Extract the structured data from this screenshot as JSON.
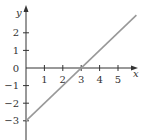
{
  "chart_data": {
    "type": "line",
    "title": "",
    "xlabel": "x",
    "ylabel": "y",
    "xlim": [
      0,
      6
    ],
    "ylim": [
      -3.8,
      3.6
    ],
    "grid": false,
    "legend": null,
    "x_ticks": [
      1,
      2,
      3,
      4,
      5
    ],
    "y_ticks": [
      2,
      1,
      0,
      -1,
      -2,
      -3
    ],
    "x_tick_labels": [
      "1",
      "2",
      "3",
      "4",
      "5"
    ],
    "y_tick_labels": [
      "2",
      "1",
      "0",
      "−1",
      "−2",
      "−3"
    ],
    "series": [
      {
        "name": "y = x - 3",
        "x": [
          0,
          6
        ],
        "y": [
          -3,
          3
        ],
        "color": "#999999"
      }
    ],
    "annotations": [
      {
        "type": "point",
        "x": 0,
        "y": -3,
        "note": "y-intercept"
      },
      {
        "type": "point",
        "x": 3,
        "y": 0,
        "note": "x-intercept"
      }
    ]
  },
  "colors": {
    "axis": "#333333",
    "line": "#999999"
  }
}
